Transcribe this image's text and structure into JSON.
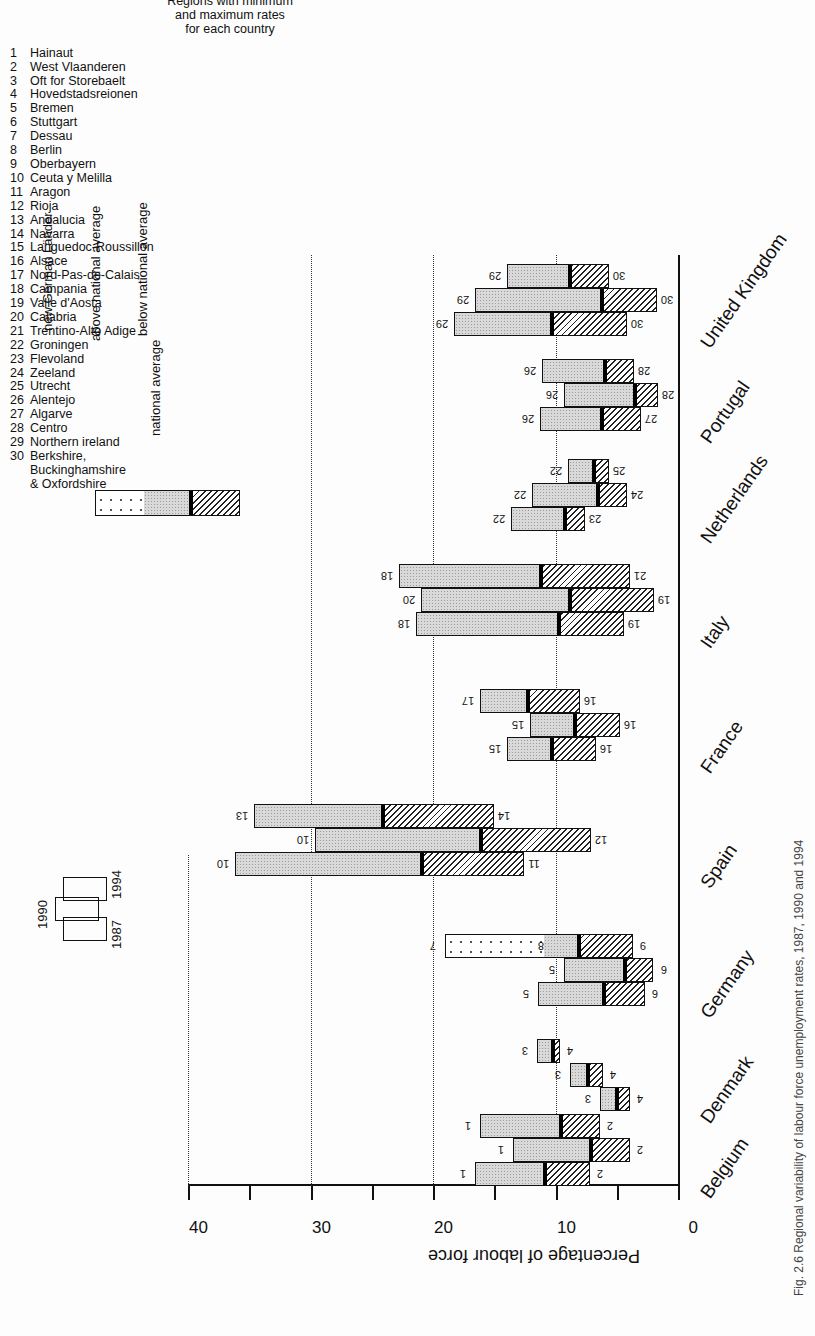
{
  "figure": {
    "caption": "Fig. 2.6 Regional variability of labour force unemployment rates, 1987, 1990 and 1994",
    "y_axis_title": "Percentage of labour force",
    "y_ticks": [
      "0",
      "10",
      "20",
      "30",
      "40"
    ],
    "year_key": {
      "y1987": "1987",
      "y1990": "1990",
      "y1994": "1994"
    },
    "legend": {
      "new_lander": "new German Länder",
      "above": "above national average",
      "below": "below national average",
      "national_average": "national average"
    },
    "regions_title": [
      "Regions with minimum",
      "and maximum rates",
      "for each country"
    ],
    "regions": [
      {
        "n": "1",
        "name": "Hainaut"
      },
      {
        "n": "2",
        "name": "West Vlaanderen"
      },
      {
        "n": "3",
        "name": "Oft for Storebaelt"
      },
      {
        "n": "4",
        "name": "Hovedstadsreionen"
      },
      {
        "n": "5",
        "name": "Bremen"
      },
      {
        "n": "6",
        "name": "Stuttgart"
      },
      {
        "n": "7",
        "name": "Dessau"
      },
      {
        "n": "8",
        "name": "Berlin"
      },
      {
        "n": "9",
        "name": "Oberbayern"
      },
      {
        "n": "10",
        "name": "Ceuta y Melilla"
      },
      {
        "n": "11",
        "name": "Aragon"
      },
      {
        "n": "12",
        "name": "Rioja"
      },
      {
        "n": "13",
        "name": "Andalucia"
      },
      {
        "n": "14",
        "name": "Navarra"
      },
      {
        "n": "15",
        "name": "Languedoc-Roussillon"
      },
      {
        "n": "16",
        "name": "Alsace"
      },
      {
        "n": "17",
        "name": "Nord-Pas-de-Calais"
      },
      {
        "n": "18",
        "name": "Campania"
      },
      {
        "n": "19",
        "name": "Valle d'Aosta"
      },
      {
        "n": "20",
        "name": "Calabria"
      },
      {
        "n": "21",
        "name": "Trentino-Alto Adige"
      },
      {
        "n": "22",
        "name": "Groningen"
      },
      {
        "n": "23",
        "name": "Flevoland"
      },
      {
        "n": "24",
        "name": "Zeeland"
      },
      {
        "n": "25",
        "name": "Utrecht"
      },
      {
        "n": "26",
        "name": "Alentejo"
      },
      {
        "n": "27",
        "name": "Algarve"
      },
      {
        "n": "28",
        "name": "Centro"
      },
      {
        "n": "29",
        "name": "Northern ireland"
      },
      {
        "n": "30",
        "name": "Berkshire,"
      },
      {
        "n": "",
        "name": "Buckinghamshire"
      },
      {
        "n": "",
        "name": "& Oxfordshire"
      }
    ]
  },
  "chart_data": {
    "type": "bar",
    "subtype": "floating-range (min / national average / max) per year",
    "xlabel": "",
    "ylabel": "Percentage of labour force",
    "ylim": [
      0,
      40
    ],
    "yticks": [
      0,
      10,
      20,
      30,
      40
    ],
    "grid": "dotted horizontal at 10, 20, 30, 40",
    "years": [
      "1987",
      "1990",
      "1994"
    ],
    "categories": [
      "Belgium",
      "Denmark",
      "Germany",
      "Spain",
      "France",
      "Italy",
      "Netherlands",
      "Portugal",
      "United Kingdom"
    ],
    "series": [
      {
        "country": "Belgium",
        "bars": [
          {
            "year": "1987",
            "max": 16.6,
            "avg": 10.9,
            "min": 7.2,
            "max_region": "1",
            "min_region": "2"
          },
          {
            "year": "1990",
            "max": 13.5,
            "avg": 7.2,
            "min": 3.9,
            "max_region": "1",
            "min_region": "2"
          },
          {
            "year": "1994",
            "max": 16.2,
            "avg": 9.6,
            "min": 6.4,
            "max_region": "1",
            "min_region": "2"
          }
        ]
      },
      {
        "country": "Denmark",
        "bars": [
          {
            "year": "1987",
            "max": 6.4,
            "avg": 5.1,
            "min": 3.9,
            "max_region": "3",
            "min_region": "4"
          },
          {
            "year": "1990",
            "max": 8.8,
            "avg": 7.4,
            "min": 6.1,
            "max_region": "3",
            "min_region": "4"
          },
          {
            "year": "1994",
            "max": 11.5,
            "avg": 10.3,
            "min": 9.6,
            "max_region": "3",
            "min_region": "4"
          }
        ]
      },
      {
        "country": "Germany",
        "bars": [
          {
            "year": "1987",
            "max": 11.4,
            "avg": 6.1,
            "min": 2.7,
            "max_region": "5",
            "min_region": "6"
          },
          {
            "year": "1990",
            "max": 9.3,
            "avg": 4.4,
            "min": 2.0,
            "max_region": "5",
            "min_region": "6"
          },
          {
            "year": "1994",
            "max": 19.0,
            "avg": 8.2,
            "min": 3.7,
            "max_region": "7",
            "min_region": "9",
            "new_lander_from": 11.0,
            "western_max_region": "8",
            "western_max": 11.0
          }
        ]
      },
      {
        "country": "Spain",
        "bars": [
          {
            "year": "1987",
            "max": 36.2,
            "avg": 21.0,
            "min": 12.6,
            "max_region": "10",
            "min_region": "11"
          },
          {
            "year": "1990",
            "max": 29.6,
            "avg": 16.2,
            "min": 7.1,
            "max_region": "10",
            "min_region": "12"
          },
          {
            "year": "1994",
            "max": 34.6,
            "avg": 24.2,
            "min": 15.0,
            "max_region": "13",
            "min_region": "14"
          }
        ]
      },
      {
        "country": "France",
        "bars": [
          {
            "year": "1987",
            "max": 14.0,
            "avg": 10.4,
            "min": 6.7,
            "max_region": "15",
            "min_region": "16"
          },
          {
            "year": "1990",
            "max": 12.1,
            "avg": 8.5,
            "min": 4.7,
            "max_region": "15",
            "min_region": "16"
          },
          {
            "year": "1994",
            "max": 16.2,
            "avg": 12.3,
            "min": 8.0,
            "max_region": "17",
            "min_region": "16"
          }
        ]
      },
      {
        "country": "Italy",
        "bars": [
          {
            "year": "1987",
            "max": 21.4,
            "avg": 9.8,
            "min": 4.4,
            "max_region": "18",
            "min_region": "19"
          },
          {
            "year": "1990",
            "max": 21.0,
            "avg": 8.9,
            "min": 2.0,
            "max_region": "20",
            "min_region": "19"
          },
          {
            "year": "1994",
            "max": 22.8,
            "avg": 11.3,
            "min": 3.9,
            "max_region": "18",
            "min_region": "21"
          }
        ]
      },
      {
        "country": "Netherlands",
        "bars": [
          {
            "year": "1987",
            "max": 13.6,
            "avg": 9.3,
            "min": 7.6,
            "max_region": "22",
            "min_region": "23"
          },
          {
            "year": "1990",
            "max": 11.9,
            "avg": 6.6,
            "min": 4.2,
            "max_region": "22",
            "min_region": "24"
          },
          {
            "year": "1994",
            "max": 9.0,
            "avg": 6.9,
            "min": 5.6,
            "max_region": "22",
            "min_region": "25"
          }
        ]
      },
      {
        "country": "Portugal",
        "bars": [
          {
            "year": "1987",
            "max": 11.3,
            "avg": 6.3,
            "min": 3.0,
            "max_region": "26",
            "min_region": "27"
          },
          {
            "year": "1990",
            "max": 9.3,
            "avg": 3.6,
            "min": 1.6,
            "max_region": "26",
            "min_region": "28"
          },
          {
            "year": "1994",
            "max": 11.1,
            "avg": 6.0,
            "min": 3.6,
            "max_region": "26",
            "min_region": "28"
          }
        ]
      },
      {
        "country": "United Kingdom",
        "bars": [
          {
            "year": "1987",
            "max": 18.3,
            "avg": 10.4,
            "min": 4.2,
            "max_region": "29",
            "min_region": "30"
          },
          {
            "year": "1990",
            "max": 16.6,
            "avg": 6.3,
            "min": 1.7,
            "max_region": "29",
            "min_region": "30"
          },
          {
            "year": "1994",
            "max": 14.0,
            "avg": 8.9,
            "min": 5.6,
            "max_region": "29",
            "min_region": "30"
          }
        ]
      }
    ],
    "legend": [
      "new German Länder",
      "above national average",
      "national average",
      "below national average"
    ],
    "legend_position": "top"
  }
}
